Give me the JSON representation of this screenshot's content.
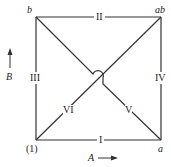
{
  "diagram": {
    "type": "factorial-design-square",
    "vertices": {
      "bottom_left": "(1)",
      "bottom_right": "a",
      "top_left": "b",
      "top_right": "ab"
    },
    "edges": {
      "bottom": "I",
      "top": "II",
      "left": "III",
      "right": "IV",
      "diagonal_b_to_a": "V",
      "diagonal_1_to_ab": "VI"
    },
    "axes": {
      "horizontal": {
        "label": "A",
        "arrow": "right"
      },
      "vertical": {
        "label": "B",
        "arrow": "up"
      }
    },
    "colors": {
      "line": "#333333",
      "text": "#222222",
      "background": "#ffffff"
    }
  }
}
